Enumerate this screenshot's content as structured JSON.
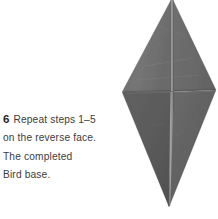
{
  "instruction": {
    "step_number": "6",
    "lines": [
      "Repeat steps 1–5",
      "on the reverse face.",
      "The completed",
      "Bird base."
    ]
  },
  "figure": {
    "name": "bird-base-origami-model",
    "colors": {
      "paper_light": "#747474",
      "paper_mid": "#6a6a6a",
      "paper_dark": "#5c5c5c",
      "paper_darkest": "#4f4f4f",
      "crease_highlight": "#9a9a9a",
      "crease_shadow": "#3f3f3f",
      "background": "#ffffff"
    }
  },
  "page": {
    "background": "#ffffff",
    "text_color": "#3c3c3c"
  }
}
